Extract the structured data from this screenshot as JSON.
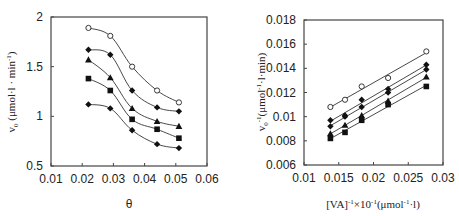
{
  "chart_data": [
    {
      "type": "line",
      "title": "",
      "xlabel": "θ",
      "ylabel": "v₀ (μmol·l⁻¹·min⁻¹)",
      "ylabel_display": "v₀ (μmol·l·min⁻¹)",
      "xlim": [
        0.01,
        0.06
      ],
      "ylim": [
        0.5,
        2
      ],
      "xticks": [
        "0.01",
        "0.02",
        "0.03",
        "0.04",
        "0.05",
        "0.06"
      ],
      "yticks": [
        "0.5",
        "1",
        "1.5",
        "2"
      ],
      "grid": false,
      "legend": "none",
      "x": [
        0.022,
        0.029,
        0.036,
        0.044,
        0.051
      ],
      "series": [
        {
          "name": "open-circle",
          "marker": "circle-open",
          "values": [
            1.89,
            1.81,
            1.5,
            1.26,
            1.14
          ]
        },
        {
          "name": "diamond-upper",
          "marker": "diamond",
          "values": [
            1.67,
            1.62,
            1.26,
            1.09,
            1.05
          ]
        },
        {
          "name": "triangle",
          "marker": "triangle",
          "values": [
            1.57,
            1.39,
            1.08,
            0.95,
            0.9
          ]
        },
        {
          "name": "square",
          "marker": "square",
          "values": [
            1.38,
            1.26,
            0.97,
            0.87,
            0.78
          ]
        },
        {
          "name": "diamond-lower",
          "marker": "diamond",
          "values": [
            1.12,
            1.08,
            0.86,
            0.72,
            0.68
          ]
        }
      ]
    },
    {
      "type": "line",
      "title": "",
      "xlabel": "[VA]⁻¹×10⁻¹(μmol⁻¹·l)",
      "ylabel": "v₀⁻¹(μmol⁻¹·l·min)",
      "xlim": [
        0.01,
        0.03
      ],
      "ylim": [
        0.006,
        0.018
      ],
      "xticks": [
        "0.01",
        "0.015",
        "0.02",
        "0.025",
        "0.03"
      ],
      "yticks": [
        "0.006",
        "0.008",
        "0.01",
        "0.012",
        "0.014",
        "0.016",
        "0.018"
      ],
      "grid": false,
      "legend": "none",
      "x": [
        0.0138,
        0.0159,
        0.0183,
        0.0221,
        0.0276
      ],
      "series": [
        {
          "name": "open-circle",
          "marker": "circle-open",
          "values": [
            0.0108,
            0.0114,
            0.0125,
            0.0132,
            0.0154
          ]
        },
        {
          "name": "diamond-upper",
          "marker": "diamond",
          "values": [
            0.0097,
            0.0101,
            0.0114,
            0.0123,
            0.0143
          ]
        },
        {
          "name": "diamond-lower",
          "marker": "diamond",
          "values": [
            0.0092,
            0.01,
            0.0108,
            0.012,
            0.0139
          ]
        },
        {
          "name": "triangle",
          "marker": "triangle",
          "values": [
            0.0086,
            0.0093,
            0.0101,
            0.0113,
            0.0133
          ]
        },
        {
          "name": "square",
          "marker": "square",
          "values": [
            0.0082,
            0.0087,
            0.0097,
            0.011,
            0.0125
          ]
        }
      ]
    }
  ],
  "left": {
    "xlabel": "θ",
    "ylabel_main": "v",
    "ylabel_sub": "0",
    "ylabel_rest": " (μmol·l · min",
    "ylabel_sup": "-1",
    "ylabel_close": ")"
  },
  "right": {
    "xlabel_main": "[VA]",
    "xlabel_sup1": "-1",
    "xlabel_mid": "×10",
    "xlabel_sup2": "-1",
    "xlabel_rest": "(μmol",
    "xlabel_sup3": "-1",
    "xlabel_end": "·l)",
    "ylabel_main": "v",
    "ylabel_sub": "0",
    "ylabel_sup": "-1",
    "ylabel_rest": "(μmol",
    "ylabel_sup2": "-1",
    "ylabel_end": "·l·min)"
  }
}
